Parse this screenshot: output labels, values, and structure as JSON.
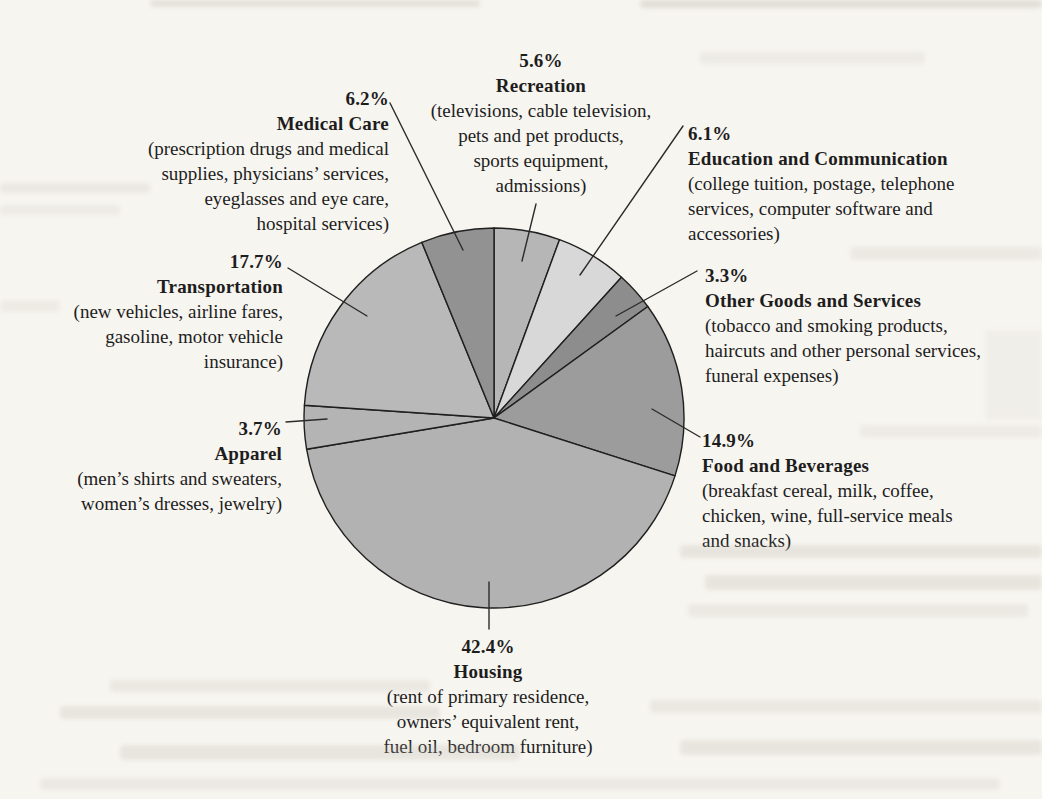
{
  "page": {
    "background_color": "#f7f5f0",
    "text_color": "#1d1d1d",
    "line_color": "#2b2b2b"
  },
  "chart_data": {
    "type": "pie",
    "title": "",
    "unit": "percent",
    "start_angle": "12 o'clock, clockwise",
    "legend_position": "callout labels around pie",
    "grid": false,
    "slices": [
      {
        "name": "Recreation",
        "value": 5.6,
        "pct_label": "5.6%",
        "color": "#b6b6b6",
        "detail_lines": [
          "(televisions, cable television,",
          "pets and pet products,",
          "sports equipment,",
          "admissions)"
        ]
      },
      {
        "name": "Education and Communication",
        "value": 6.1,
        "pct_label": "6.1%",
        "color": "#d8d8d8",
        "detail_lines": [
          "(college tuition, postage, telephone",
          "services, computer software and",
          "accessories)"
        ]
      },
      {
        "name": "Other Goods and Services",
        "value": 3.3,
        "pct_label": "3.3%",
        "color": "#8d8d8d",
        "detail_lines": [
          "(tobacco and smoking products,",
          "haircuts and other personal services,",
          "funeral expenses)"
        ]
      },
      {
        "name": "Food and Beverages",
        "value": 14.9,
        "pct_label": "14.9%",
        "color": "#9c9c9c",
        "detail_lines": [
          "(breakfast cereal, milk, coffee,",
          "chicken, wine, full-service meals",
          "and snacks)"
        ]
      },
      {
        "name": "Housing",
        "value": 42.4,
        "pct_label": "42.4%",
        "color": "#b2b2b2",
        "detail_lines": [
          "(rent of primary residence,",
          "owners’ equivalent rent,",
          "fuel oil, bedroom furniture)"
        ]
      },
      {
        "name": "Apparel",
        "value": 3.7,
        "pct_label": "3.7%",
        "color": "#b4b4b4",
        "detail_lines": [
          "(men’s shirts and sweaters,",
          "women’s dresses, jewelry)"
        ]
      },
      {
        "name": "Transportation",
        "value": 17.7,
        "pct_label": "17.7%",
        "color": "#b9b9b9",
        "detail_lines": [
          "(new vehicles, airline fares,",
          "gasoline, motor vehicle",
          "insurance)"
        ]
      },
      {
        "name": "Medical Care",
        "value": 6.2,
        "pct_label": "6.2%",
        "color": "#929292",
        "detail_lines": [
          "(prescription drugs and medical",
          "supplies, physicians’ services,",
          "eyeglasses and eye care,",
          "hospital services)"
        ]
      }
    ]
  }
}
